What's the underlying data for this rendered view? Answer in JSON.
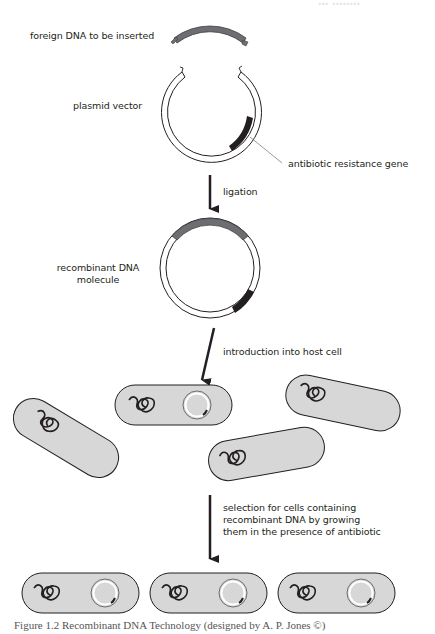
{
  "header_faint": "... ........",
  "steps": {
    "foreign_dna_label": "foreign DNA to be inserted",
    "plasmid_label": "plasmid vector",
    "resistance_label": "antibiotic resistance gene",
    "ligation_label": "ligation",
    "recombinant_label_line1": "recombinant DNA",
    "recombinant_label_line2": "molecule",
    "introduction_label": "introduction into host cell",
    "selection_line1": "selection for cells containing",
    "selection_line2": "recombinant DNA by growing",
    "selection_line3": "them in the presence of antibiotic"
  },
  "caption": "Figure 1.2  Recombinant DNA Technology (designed by A. P. Jones ©)",
  "colors": {
    "insert_gray": "#6d6e71",
    "resistance_black": "#231f20",
    "cell_fill": "#d7d7d8",
    "outline": "#231f20"
  }
}
